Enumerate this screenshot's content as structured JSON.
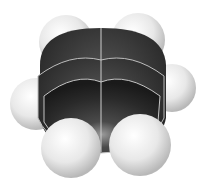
{
  "image": {
    "subject": "Space-filling molecular model of benzene",
    "atoms": {
      "carbon_count": 6,
      "hydrogen_count": 6
    },
    "colors": {
      "background": "#ffffff",
      "carbon": "#2a2a2a",
      "hydrogen": "#e6e6e6"
    }
  }
}
